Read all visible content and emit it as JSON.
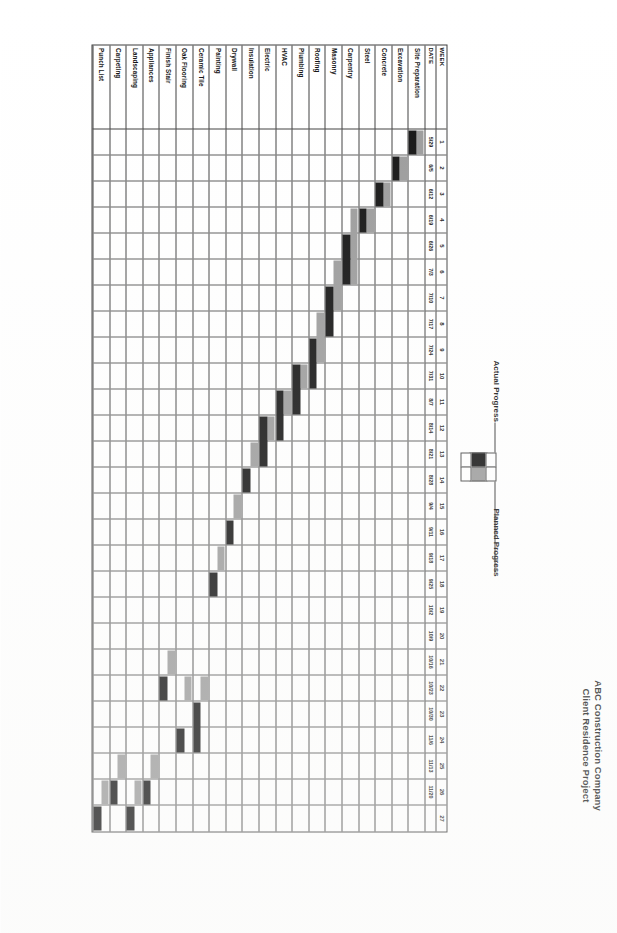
{
  "document": {
    "title_line1": "ABC Construction Company",
    "title_line2": "Client Residence Project"
  },
  "legend": {
    "actual_label": "Actual Progress",
    "planned_label": "Planned Progress",
    "actual_color": "#101010",
    "planned_color": "#9a9a9a"
  },
  "table": {
    "week_header": "WEEK",
    "date_header": "DATE"
  },
  "chart_data": {
    "type": "bar",
    "title": "ABC Construction Company Client Residence Project",
    "xlabel": "WEEK",
    "ylabel": "",
    "grid": true,
    "legend_position": "top",
    "weeks": [
      "1",
      "2",
      "3",
      "4",
      "5",
      "6",
      "7",
      "8",
      "9",
      "10",
      "11",
      "12",
      "13",
      "14",
      "15",
      "16",
      "17",
      "18",
      "19",
      "20",
      "21",
      "22",
      "23",
      "24",
      "25",
      "26",
      "27"
    ],
    "dates": [
      "5/29",
      "6/5",
      "6/12",
      "6/19",
      "6/26",
      "7/3",
      "7/10",
      "7/17",
      "7/24",
      "7/31",
      "8/7",
      "8/14",
      "8/21",
      "8/28",
      "9/4",
      "9/11",
      "9/18",
      "9/25",
      "10/2",
      "10/9",
      "10/16",
      "10/23",
      "10/30",
      "11/6",
      "11/13",
      "11/20"
    ],
    "date_row": [
      "5/22 -\n6/8",
      "6/1 -\n6/12",
      "6/15 -\n6/29",
      "6/21 -\n6/29",
      "7/3 -\n7/27",
      "7/31 -\n8/14"
    ],
    "tasks": [
      {
        "name": "Site Preparation",
        "planned_start": 1,
        "planned_end": 2,
        "actual_start": 1,
        "actual_end": 2
      },
      {
        "name": "Excavation",
        "planned_start": 2,
        "planned_end": 3,
        "actual_start": 2,
        "actual_end": 3
      },
      {
        "name": "Concrete",
        "planned_start": 3,
        "planned_end": 4,
        "actual_start": 3,
        "actual_end": 4
      },
      {
        "name": "Steel",
        "planned_start": 4,
        "planned_end": 5,
        "actual_start": 4,
        "actual_end": 5
      },
      {
        "name": "Carpentry",
        "planned_start": 4,
        "planned_end": 7,
        "actual_start": 5,
        "actual_end": 7
      },
      {
        "name": "Masonry",
        "planned_start": 6,
        "planned_end": 8,
        "actual_start": 7,
        "actual_end": 9
      },
      {
        "name": "Roofing",
        "planned_start": 8,
        "planned_end": 10,
        "actual_start": 9,
        "actual_end": 11
      },
      {
        "name": "Plumbing",
        "planned_start": 10,
        "planned_end": 11,
        "actual_start": 10,
        "actual_end": 12
      },
      {
        "name": "HVAC",
        "planned_start": 11,
        "planned_end": 12,
        "actual_start": 11,
        "actual_end": 13
      },
      {
        "name": "Electric",
        "planned_start": 12,
        "planned_end": 13,
        "actual_start": 12,
        "actual_end": 14
      },
      {
        "name": "Insulation",
        "planned_start": 13,
        "planned_end": 14,
        "actual_start": 14,
        "actual_end": 15
      },
      {
        "name": "Drywall",
        "planned_start": 15,
        "planned_end": 16,
        "actual_start": 16,
        "actual_end": 17
      },
      {
        "name": "Painting",
        "planned_start": 17,
        "planned_end": 18,
        "actual_start": 18,
        "actual_end": 19
      },
      {
        "name": "Ceramic Tile",
        "planned_start": 22,
        "planned_end": 23,
        "actual_start": 23,
        "actual_end": 25
      },
      {
        "name": "Oak Flooring",
        "planned_start": 22,
        "planned_end": 23,
        "actual_start": 24,
        "actual_end": 25
      },
      {
        "name": "Finish Stair",
        "planned_start": 21,
        "planned_end": 22,
        "actual_start": 22,
        "actual_end": 23
      },
      {
        "name": "Appliances",
        "planned_start": 25,
        "planned_end": 26,
        "actual_start": 26,
        "actual_end": 27
      },
      {
        "name": "Landscaping",
        "planned_start": 26,
        "planned_end": 27,
        "actual_start": 27,
        "actual_end": 28
      },
      {
        "name": "Carpeting",
        "planned_start": 25,
        "planned_end": 26,
        "actual_start": 26,
        "actual_end": 27
      },
      {
        "name": "Punch List",
        "planned_start": 26,
        "planned_end": 27,
        "actual_start": 27,
        "actual_end": 28
      }
    ]
  }
}
